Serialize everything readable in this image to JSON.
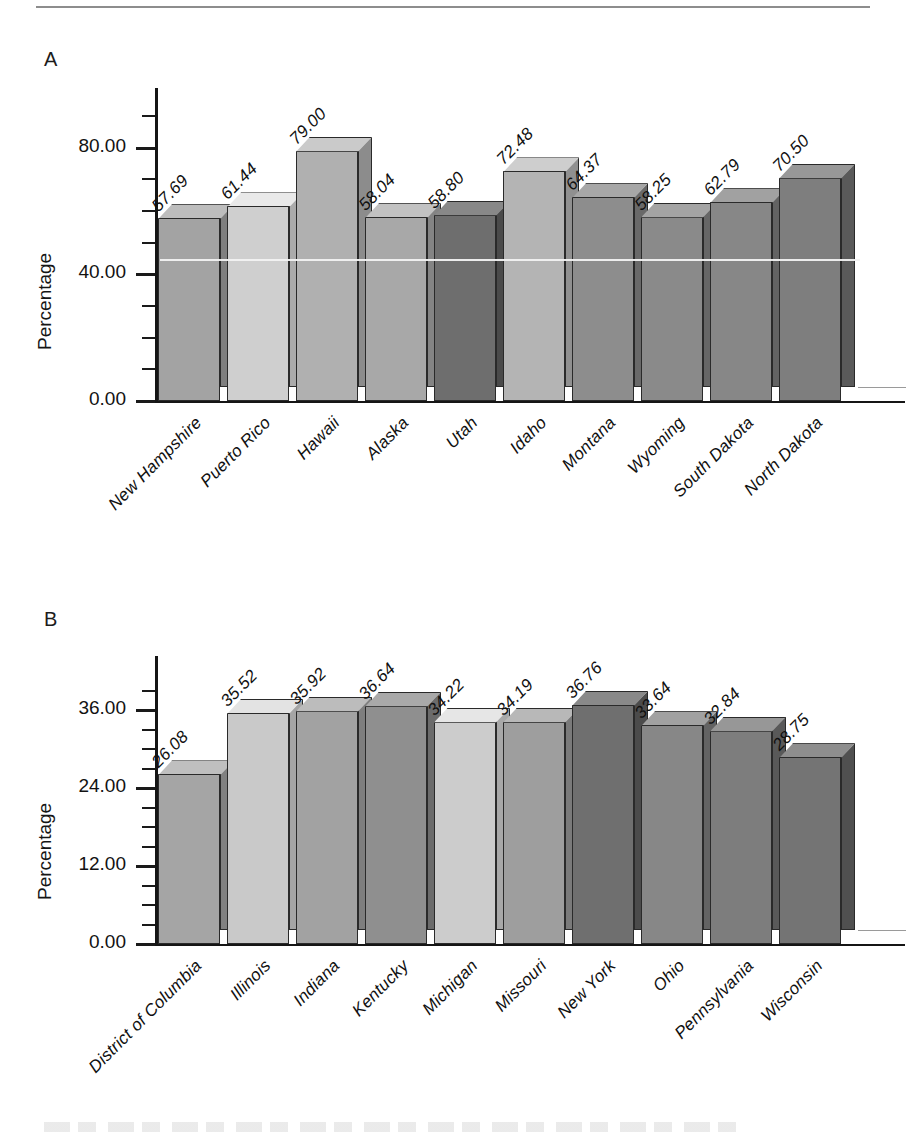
{
  "figure": {
    "panels": [
      "A",
      "B"
    ],
    "axis_title": "Percentage"
  },
  "panelA": {
    "letter": "A",
    "ylabel": "Percentage",
    "ytick_labels": [
      "0.00",
      "40.00",
      "80.00"
    ]
  },
  "panelB": {
    "letter": "B",
    "ylabel": "Percentage",
    "ytick_labels": [
      "0.00",
      "12.00",
      "24.00",
      "36.00"
    ]
  },
  "chart_data": [
    {
      "type": "bar",
      "panel": "A",
      "title": "",
      "xlabel": "",
      "ylabel": "Percentage",
      "ylim": [
        0,
        90
      ],
      "yticks": [
        0,
        40,
        80
      ],
      "ytick_labels": [
        "0.00",
        "40.00",
        "80.00"
      ],
      "minor_tick_step": 10,
      "grid": false,
      "legend": "none",
      "categories": [
        "New Hampshire",
        "Puerto Rico",
        "Hawaii",
        "Alaska",
        "Utah",
        "Idaho",
        "Montana",
        "Wyoming",
        "South Dakota",
        "North Dakota"
      ],
      "values": [
        57.69,
        61.44,
        79.0,
        58.04,
        58.8,
        72.48,
        64.37,
        58.25,
        62.79,
        70.5
      ],
      "value_labels": [
        "57.69",
        "61.44",
        "79.00",
        "58.04",
        "58.80",
        "72.48",
        "64.37",
        "58.25",
        "62.79",
        "70.50"
      ],
      "bar_colors": [
        "#a3a3a3",
        "#cfcfcf",
        "#b0b0b0",
        "#a8a8a8",
        "#6e6e6e",
        "#b4b4b4",
        "#8d8d8d",
        "#8a8a8a",
        "#878787",
        "#7e7e7e"
      ]
    },
    {
      "type": "bar",
      "panel": "B",
      "title": "",
      "xlabel": "",
      "ylabel": "Percentage",
      "ylim": [
        0,
        40
      ],
      "yticks": [
        0,
        12,
        24,
        36
      ],
      "ytick_labels": [
        "0.00",
        "12.00",
        "24.00",
        "36.00"
      ],
      "minor_tick_step": 3,
      "grid": false,
      "legend": "none",
      "categories": [
        "District of Columbia",
        "Illinois",
        "Indiana",
        "Kentucky",
        "Michigan",
        "Missouri",
        "New York",
        "Ohio",
        "Pennsylvania",
        "Wisconsin"
      ],
      "values": [
        26.08,
        35.52,
        35.92,
        36.64,
        34.22,
        34.19,
        36.76,
        33.64,
        32.84,
        28.75
      ],
      "value_labels": [
        "26.08",
        "35.52",
        "35.92",
        "36.64",
        "34.22",
        "34.19",
        "36.76",
        "33.64",
        "32.84",
        "28.75"
      ],
      "bar_colors": [
        "#a5a5a5",
        "#c9c9c9",
        "#a2a2a2",
        "#8f8f8f",
        "#cccccc",
        "#9e9e9e",
        "#6f6f6f",
        "#878787",
        "#7d7d7d",
        "#747474"
      ]
    }
  ]
}
